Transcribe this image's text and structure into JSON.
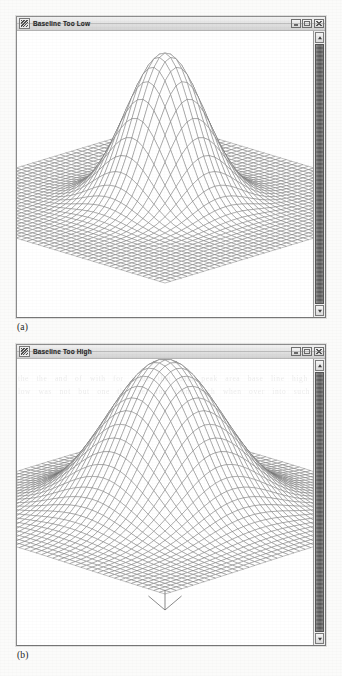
{
  "page": {
    "kind": "scanned-figure-page",
    "background_color": "#fbfbfa",
    "ink_color": "#1c1c1c"
  },
  "figures": [
    {
      "id": "figure-a",
      "caption": "(a)",
      "window": {
        "title": "Baseline Too Low",
        "system_icon": "app-system-icon",
        "controls": [
          {
            "name": "minimize-button",
            "label": "_",
            "icon": "minimize-icon"
          },
          {
            "name": "maximize-button",
            "label": "□",
            "icon": "maximize-icon"
          },
          {
            "name": "close-button",
            "label": "×",
            "icon": "close-icon"
          }
        ],
        "scrollbar": {
          "orientation": "vertical",
          "up_arrow": "▲",
          "down_arrow": "▼",
          "thumb_position_percent": 0,
          "thumb_size_percent": 100
        }
      },
      "chart_data": {
        "type": "surface",
        "title": "Baseline Too Low",
        "description": "3D wireframe mesh surface plot of a single Gaussian peak sitting on a flat zero baseline plane. The baseline plane is clearly separated below the peak skirt, so the peak appears to rise abruptly from a flat floor.",
        "projection": "isometric-3d-mesh",
        "grid": true,
        "xlabel": "",
        "ylabel": "",
        "zlabel": "",
        "xlim": [
          -4,
          4
        ],
        "ylim": [
          -4,
          4
        ],
        "zlim": [
          0,
          1
        ],
        "peak": {
          "center_x": 0,
          "center_y": 0,
          "amplitude": 1.0,
          "sigma": 0.85,
          "baseline": 0.0
        },
        "mesh": {
          "rows": 48,
          "cols": 48
        },
        "surface_color": "#6f6f6f",
        "baseline_plane_visible": true
      }
    },
    {
      "id": "figure-b",
      "caption": "(b)",
      "window": {
        "title": "Baseline Too High",
        "system_icon": "app-system-icon",
        "controls": [
          {
            "name": "minimize-button",
            "label": "_",
            "icon": "minimize-icon"
          },
          {
            "name": "maximize-button",
            "label": "□",
            "icon": "maximize-icon"
          },
          {
            "name": "close-button",
            "label": "×",
            "icon": "close-icon"
          }
        ],
        "scrollbar": {
          "orientation": "vertical",
          "up_arrow": "▲",
          "down_arrow": "▼",
          "thumb_position_percent": 0,
          "thumb_size_percent": 100
        }
      },
      "chart_data": {
        "type": "surface",
        "title": "Baseline Too High",
        "description": "3D wireframe mesh surface plot of a single broad Gaussian peak whose skirts merge smoothly into the raised baseline, so no flat floor is visible. A small V-shaped notch dips below the front corner of the surface.",
        "projection": "isometric-3d-mesh",
        "grid": true,
        "xlabel": "",
        "ylabel": "",
        "zlabel": "",
        "xlim": [
          -4,
          4
        ],
        "ylim": [
          -4,
          4
        ],
        "zlim": [
          0,
          1
        ],
        "peak": {
          "center_x": 0,
          "center_y": 0,
          "amplitude": 1.0,
          "sigma": 1.25,
          "baseline": 0.18
        },
        "mesh": {
          "rows": 48,
          "cols": 48
        },
        "surface_color": "#6f6f6f",
        "baseline_plane_visible": false,
        "notch_marker": true
      }
    }
  ],
  "bleed_through_text": "the the and of with for value that data peak area base line high low was not but one this set run from each when over into such"
}
